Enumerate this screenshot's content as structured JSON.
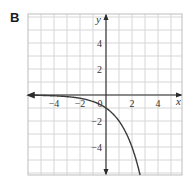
{
  "panel": {
    "label": "B"
  },
  "chart_data": {
    "type": "line",
    "title": "",
    "panel_label": "B",
    "function": "y = -2^x",
    "xlabel": "x",
    "ylabel": "y",
    "xlim": [
      -6,
      6
    ],
    "ylim": [
      -6,
      6
    ],
    "grid": true,
    "grid_step": 1,
    "x_ticks": [
      -4,
      -2,
      0,
      2,
      4
    ],
    "x_tick_labels": [
      "−4",
      "−2",
      "0",
      "2",
      "4"
    ],
    "y_ticks": [
      4,
      2,
      -2,
      -4
    ],
    "y_tick_labels": [
      "4",
      "2",
      "−2",
      "−4"
    ],
    "series": [
      {
        "name": "y = -2^x",
        "x": [
          -6,
          -5,
          -4,
          -3,
          -2,
          -1,
          0,
          0.5,
          1,
          1.5,
          2,
          2.5,
          2.58
        ],
        "y": [
          -0.016,
          -0.031,
          -0.063,
          -0.125,
          -0.25,
          -0.5,
          -1,
          -1.41,
          -2,
          -2.83,
          -4,
          -5.66,
          -6
        ]
      }
    ],
    "annotations": [
      "arrow on left end of curve (asymptote y=0)"
    ],
    "legend": null
  },
  "colors": {
    "grid": "#d6d6d6",
    "frame": "#bdbdbd",
    "axis": "#2b2b2b",
    "curve": "#3a3a3a"
  }
}
